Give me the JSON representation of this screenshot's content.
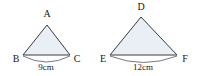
{
  "figure": {
    "background_color": "#ffffff",
    "fill_color": "#e9eff4",
    "stroke_color": "#3a3a42",
    "text_color": "#17171c",
    "triangles": [
      {
        "id": "triangle-abc",
        "vertices": [
          {
            "name": "A",
            "label": "A",
            "role": "apex"
          },
          {
            "name": "B",
            "label": "B",
            "role": "base-left"
          },
          {
            "name": "C",
            "label": "C",
            "role": "base-right"
          }
        ],
        "dimension": {
          "side": "BC",
          "label": "9cm",
          "value": 9,
          "unit": "cm"
        }
      },
      {
        "id": "triangle-def",
        "vertices": [
          {
            "name": "D",
            "label": "D",
            "role": "apex"
          },
          {
            "name": "E",
            "label": "E",
            "role": "base-left"
          },
          {
            "name": "F",
            "label": "F",
            "role": "base-right"
          }
        ],
        "dimension": {
          "side": "EF",
          "label": "12cm",
          "value": 12,
          "unit": "cm"
        }
      }
    ]
  }
}
